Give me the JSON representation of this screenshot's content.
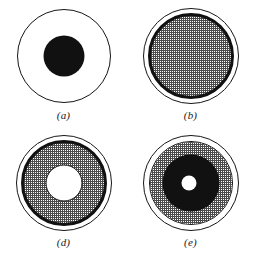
{
  "figure": {
    "background_color": "#ffffff",
    "ink_color": "#111111",
    "stipple_color": "#4a4a4a",
    "layout": "2x2 grid of circular cross-section diagrams",
    "panels": [
      {
        "id": "a",
        "label": "(a)",
        "description": "Thin outlined circle with a solid black disc centered inside",
        "layers": [
          {
            "name": "outer-outline-circle",
            "style": "outline",
            "diameter": 94
          },
          {
            "name": "core-solid-disc",
            "style": "solid",
            "diameter": 41
          }
        ]
      },
      {
        "id": "b",
        "label": "(b)",
        "description": "Thin outlined circle, white gap, thick black ring enclosing a stippled gray disc",
        "layers": [
          {
            "name": "outer-outline-circle",
            "style": "outline",
            "diameter": 96
          },
          {
            "name": "thick-black-ring",
            "style": "thick",
            "diameter": 86
          },
          {
            "name": "stipple-disc",
            "style": "stipple",
            "diameter": 80
          }
        ]
      },
      {
        "id": "d",
        "label": "(d)",
        "description": "Thin outlined circle, white gap, thick black ring, stippled annulus, white core",
        "layers": [
          {
            "name": "outer-outline-circle",
            "style": "outline",
            "diameter": 96
          },
          {
            "name": "thick-black-ring",
            "style": "thick",
            "diameter": 86
          },
          {
            "name": "stipple-disc",
            "style": "stipple",
            "diameter": 80
          },
          {
            "name": "core-white-disc",
            "style": "white-edged",
            "diameter": 37
          }
        ]
      },
      {
        "id": "e",
        "label": "(e)",
        "description": "Thin outlined circle, white gap, thin circle, stippled annulus, black annulus, small white center dot",
        "layers": [
          {
            "name": "outer-outline-circle",
            "style": "outline",
            "diameter": 96
          },
          {
            "name": "inner-outline-circle",
            "style": "outline",
            "diameter": 84
          },
          {
            "name": "stipple-disc",
            "style": "stipple",
            "diameter": 82
          },
          {
            "name": "black-annulus-disc",
            "style": "solid",
            "diameter": 57
          },
          {
            "name": "center-white-dot",
            "style": "white",
            "diameter": 15
          }
        ]
      }
    ]
  }
}
